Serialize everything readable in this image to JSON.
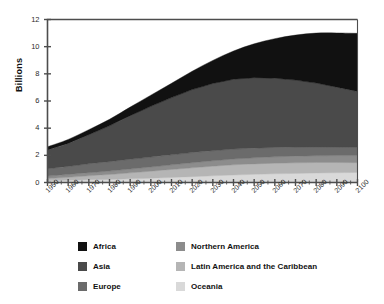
{
  "chart_data": {
    "type": "area",
    "stacked": true,
    "title": "",
    "xlabel": "",
    "ylabel": "Billions",
    "ylim": [
      0,
      12
    ],
    "xlim": [
      1950,
      2100
    ],
    "grid": false,
    "legend_position": "bottom",
    "y_ticks": [
      0,
      2,
      4,
      6,
      8,
      10,
      12
    ],
    "y_tick_labels": [
      "0",
      "2",
      "4",
      "6",
      "8",
      "10",
      "12"
    ],
    "x": [
      1950,
      1960,
      1970,
      1980,
      1990,
      2000,
      2010,
      2020,
      2030,
      2040,
      2050,
      2060,
      2070,
      2080,
      2090,
      2100
    ],
    "x_tick_labels": [
      "1950",
      "1960",
      "1970",
      "1980",
      "1990",
      "2000",
      "2010",
      "2020",
      "2030",
      "2040",
      "2050",
      "2060",
      "2070",
      "2080",
      "2090",
      "2100"
    ],
    "minor_ticks_per_interval": 2,
    "series": [
      {
        "name": "Oceania",
        "color": "#d9d9d9",
        "values": [
          0.13,
          0.16,
          0.2,
          0.23,
          0.27,
          0.31,
          0.37,
          0.43,
          0.49,
          0.55,
          0.6,
          0.64,
          0.67,
          0.7,
          0.72,
          0.74
        ]
      },
      {
        "name": "Latin America and the Caribbean",
        "color": "#b5b5b5",
        "values": [
          0.17,
          0.22,
          0.29,
          0.36,
          0.44,
          0.52,
          0.59,
          0.65,
          0.71,
          0.75,
          0.77,
          0.78,
          0.78,
          0.77,
          0.75,
          0.72
        ]
      },
      {
        "name": "Northern America",
        "color": "#8c8c8c",
        "values": [
          0.17,
          0.2,
          0.23,
          0.25,
          0.28,
          0.31,
          0.34,
          0.37,
          0.4,
          0.43,
          0.45,
          0.47,
          0.49,
          0.5,
          0.51,
          0.52
        ]
      },
      {
        "name": "Europe",
        "color": "#6b6b6b",
        "values": [
          0.55,
          0.6,
          0.66,
          0.69,
          0.72,
          0.73,
          0.74,
          0.75,
          0.74,
          0.73,
          0.71,
          0.69,
          0.67,
          0.65,
          0.63,
          0.63
        ]
      },
      {
        "name": "Asia",
        "color": "#4a4a4a",
        "values": [
          1.38,
          1.7,
          2.14,
          2.64,
          3.21,
          3.74,
          4.21,
          4.64,
          4.95,
          5.14,
          5.19,
          5.1,
          4.93,
          4.7,
          4.41,
          4.09
        ]
      },
      {
        "name": "Africa",
        "color": "#111111",
        "values": [
          0.23,
          0.29,
          0.37,
          0.48,
          0.63,
          0.82,
          1.05,
          1.35,
          1.7,
          2.08,
          2.49,
          2.91,
          3.31,
          3.68,
          3.99,
          4.28
        ]
      }
    ],
    "totals": [
      2.63,
      3.17,
      3.89,
      4.65,
      5.55,
      6.43,
      7.3,
      8.19,
      8.99,
      9.68,
      10.21,
      10.59,
      10.85,
      11.0,
      11.01,
      10.98
    ]
  },
  "legend": {
    "items": [
      {
        "label": "Africa",
        "color": "#111111"
      },
      {
        "label": "Northern America",
        "color": "#8c8c8c"
      },
      {
        "label": "Asia",
        "color": "#4a4a4a"
      },
      {
        "label": "Latin America and the Caribbean",
        "color": "#b5b5b5"
      },
      {
        "label": "Europe",
        "color": "#6b6b6b"
      },
      {
        "label": "Oceania",
        "color": "#d9d9d9"
      }
    ]
  },
  "axes": {
    "y_title": "Billions",
    "frame_color": "#4d4d4d"
  }
}
